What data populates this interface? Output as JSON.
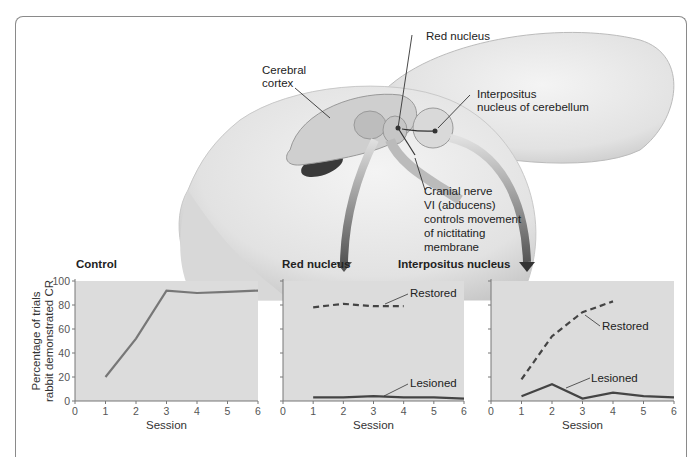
{
  "illustration": {
    "labels": {
      "red_nucleus": "Red nucleus",
      "cerebral_cortex_1": "Cerebral",
      "cerebral_cortex_2": "cortex",
      "interpositus_1": "Interpositus",
      "interpositus_2": "nucleus of cerebellum",
      "cranial_1": "Cranial nerve",
      "cranial_2": "VI (abducens)",
      "cranial_3": "controls movement",
      "cranial_4": "of nictitating",
      "cranial_5": "membrane"
    }
  },
  "panels": {
    "control": {
      "title": "Control"
    },
    "red_nucleus": {
      "title": "Red nucleus",
      "restored": "Restored",
      "lesioned": "Lesioned"
    },
    "interpositus": {
      "title": "Interpositus nucleus",
      "restored": "Restored",
      "lesioned": "Lesioned"
    }
  },
  "axes": {
    "ylabel_1": "Percentage of trials",
    "ylabel_2": "rabbit demonstrated CR",
    "xlabel": "Session",
    "yticks": [
      "0",
      "20",
      "40",
      "60",
      "80",
      "100"
    ],
    "xticks": [
      "0",
      "1",
      "2",
      "3",
      "4",
      "5",
      "6"
    ]
  },
  "chart_data": [
    {
      "type": "line",
      "title": "Control",
      "xlabel": "Session",
      "ylabel": "Percentage of trials rabbit demonstrated CR",
      "xlim": [
        0,
        6
      ],
      "ylim": [
        0,
        100
      ],
      "series": [
        {
          "name": "Control",
          "x": [
            1,
            2,
            3,
            4,
            5,
            6
          ],
          "values": [
            20,
            52,
            92,
            90,
            91,
            92
          ]
        }
      ]
    },
    {
      "type": "line",
      "title": "Red nucleus",
      "xlabel": "Session",
      "xlim": [
        0,
        6
      ],
      "ylim": [
        0,
        100
      ],
      "series": [
        {
          "name": "Restored",
          "style": "dashed",
          "x": [
            1,
            2,
            3,
            4
          ],
          "values": [
            78,
            81,
            79,
            79
          ]
        },
        {
          "name": "Lesioned",
          "style": "solid",
          "x": [
            1,
            2,
            3,
            4,
            5,
            6
          ],
          "values": [
            3,
            3,
            4,
            3,
            3,
            2
          ]
        }
      ]
    },
    {
      "type": "line",
      "title": "Interpositus nucleus",
      "xlabel": "Session",
      "xlim": [
        0,
        6
      ],
      "ylim": [
        0,
        100
      ],
      "series": [
        {
          "name": "Restored",
          "style": "dashed",
          "x": [
            1,
            2,
            2.8,
            3,
            4
          ],
          "values": [
            18,
            54,
            70,
            74,
            83
          ]
        },
        {
          "name": "Lesioned",
          "style": "solid",
          "x": [
            1,
            2,
            3,
            4,
            5,
            6
          ],
          "values": [
            4,
            14,
            2,
            7,
            4,
            3
          ]
        }
      ]
    }
  ]
}
